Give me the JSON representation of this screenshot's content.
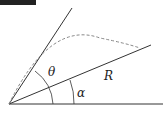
{
  "diagram": {
    "type": "projectile-on-incline",
    "labels": {
      "theta": "θ",
      "alpha": "α",
      "range": "R"
    },
    "colors": {
      "line": "#333333",
      "dashed": "#888888",
      "bar": "#222222"
    }
  }
}
